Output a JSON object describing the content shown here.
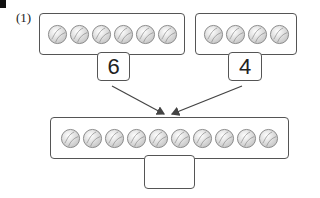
{
  "question": {
    "label": "(1)",
    "left_group": {
      "count": 6,
      "number": "6",
      "item_icon": "baseball-icon"
    },
    "right_group": {
      "count": 4,
      "number": "4",
      "item_icon": "baseball-icon"
    },
    "total_group": {
      "count": 10,
      "answer": "",
      "item_icon": "baseball-icon"
    }
  },
  "colors": {
    "border": "#555555",
    "ball_fill": "#f2f2f2",
    "ball_stroke": "#888888",
    "arrow": "#444444"
  }
}
